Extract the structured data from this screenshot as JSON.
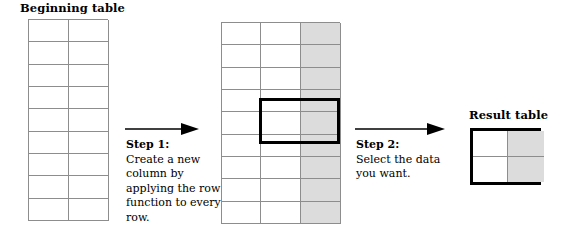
{
  "diagram": {
    "beginning": {
      "heading": "Beginning table",
      "columns": 2,
      "rows": 9,
      "shaded_columns": []
    },
    "middle": {
      "columns": 3,
      "rows": 9,
      "shaded_columns": [
        3
      ],
      "selection": {
        "start_row": 4,
        "end_row": 5,
        "start_column": 2,
        "end_column": 3
      }
    },
    "result": {
      "heading": "Result table",
      "columns": 2,
      "rows": 2,
      "shaded_columns": [
        2
      ]
    },
    "steps": [
      {
        "title": "Step 1:",
        "body": "Create a new column by applying the row function to every row."
      },
      {
        "title": "Step 2:",
        "body": "Select the data you want."
      }
    ],
    "colors": {
      "shaded_cell": "#dcdcdc",
      "grid_line": "#8d8d8d",
      "emphasis_border": "#000000",
      "background": "#ffffff"
    }
  }
}
